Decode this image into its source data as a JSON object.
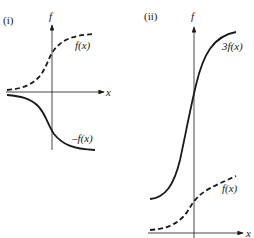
{
  "panels": [
    {
      "id": "i",
      "label": "(i)",
      "y_axis_label": "f",
      "x_axis_label": "x",
      "curves": [
        {
          "name": "f(x)",
          "style": "dashed",
          "label": "f(x)"
        },
        {
          "name": "-f(x)",
          "style": "solid",
          "label": "–f(x)"
        }
      ]
    },
    {
      "id": "ii",
      "label": "(ii)",
      "y_axis_label": "f",
      "x_axis_label": "x",
      "curves": [
        {
          "name": "3f(x)",
          "style": "solid",
          "label": "3f(x)"
        },
        {
          "name": "f(x)",
          "style": "dashed",
          "label": "f(x)"
        }
      ]
    }
  ]
}
